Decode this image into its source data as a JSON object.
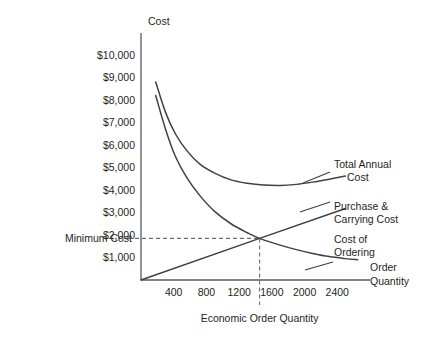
{
  "chart_data": {
    "type": "line",
    "title": "",
    "ylabel": "Cost",
    "xlabel": "Order Quantity",
    "caption": "Economic Order Quantity",
    "grid": false,
    "legend_position": "inline-right",
    "xlim": [
      0,
      2800
    ],
    "ylim": [
      0,
      10000
    ],
    "x_ticks": [
      "400",
      "800",
      "1200",
      "1600",
      "2000",
      "2400"
    ],
    "x_tick_values": [
      400,
      800,
      1200,
      1600,
      2000,
      2400
    ],
    "y_ticks": [
      "$1,000",
      "$2,000",
      "$3,000",
      "$4,000",
      "$5,000",
      "$6,000",
      "$7,000",
      "$8,000",
      "$9,000",
      "$10,000"
    ],
    "y_tick_values": [
      1000,
      2000,
      3000,
      4000,
      5000,
      6000,
      7000,
      8000,
      9000,
      10000
    ],
    "annotations": {
      "minimum_cost_label": "Minimum Cost",
      "minimum_cost_value": 1850,
      "eoq_value": 1450,
      "eoq_caption": "Economic Order Quantity"
    },
    "series": [
      {
        "name": "Total Annual Cost",
        "label_lines": [
          "Total Annual",
          "Cost"
        ],
        "shape": "u-curve",
        "points": [
          [
            180,
            8800
          ],
          [
            300,
            7450
          ],
          [
            420,
            6500
          ],
          [
            560,
            5750
          ],
          [
            720,
            5150
          ],
          [
            900,
            4750
          ],
          [
            1100,
            4450
          ],
          [
            1300,
            4300
          ],
          [
            1500,
            4220
          ],
          [
            1700,
            4200
          ],
          [
            1900,
            4250
          ],
          [
            2100,
            4350
          ],
          [
            2300,
            4480
          ],
          [
            2500,
            4620
          ]
        ]
      },
      {
        "name": "Purchase & Carrying Cost",
        "label_lines": [
          "Purchase &",
          "Carrying Cost"
        ],
        "shape": "linear-rising",
        "points": [
          [
            0,
            0
          ],
          [
            1450,
            1850
          ],
          [
            2500,
            3180
          ]
        ]
      },
      {
        "name": "Cost of Ordering",
        "label_lines": [
          "Cost of",
          "Ordering"
        ],
        "shape": "decay-curve",
        "points": [
          [
            180,
            8200
          ],
          [
            300,
            6700
          ],
          [
            420,
            5500
          ],
          [
            560,
            4550
          ],
          [
            720,
            3750
          ],
          [
            900,
            3050
          ],
          [
            1100,
            2500
          ],
          [
            1300,
            2100
          ],
          [
            1450,
            1850
          ],
          [
            1700,
            1550
          ],
          [
            1900,
            1350
          ],
          [
            2100,
            1180
          ],
          [
            2300,
            1040
          ],
          [
            2500,
            950
          ],
          [
            2650,
            900
          ]
        ]
      }
    ]
  },
  "labels": {
    "y_axis_title": "Cost",
    "x_axis_title_lines": [
      "Order",
      "Quantity"
    ],
    "minimum_cost": "Minimum Cost",
    "eoq_caption": "Economic Order Quantity"
  }
}
